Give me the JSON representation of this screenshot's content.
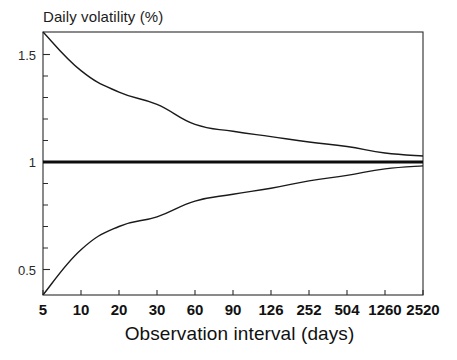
{
  "chart_data": {
    "type": "line",
    "title": "",
    "ylabel": "Daily volatility (%)",
    "xlabel": "Observation interval (days)",
    "categories": [
      "5",
      "10",
      "20",
      "30",
      "60",
      "90",
      "126",
      "252",
      "504",
      "1260",
      "2520"
    ],
    "x_tick_labels": [
      "5",
      "10",
      "20",
      "30",
      "60",
      "90",
      "126",
      "252",
      "504",
      "1260",
      "2520"
    ],
    "y_tick_labels": [
      "1.5",
      "1",
      "0.5"
    ],
    "y_tick_values": [
      1.5,
      1.0,
      0.5
    ],
    "ylim": [
      0.38,
      1.62
    ],
    "xlim": [
      0,
      10
    ],
    "grid": false,
    "legend": "none",
    "axis_note": "x-axis is categorical/log-like; ticks evenly spaced",
    "minor_ticks_y": [
      1.4,
      1.3,
      1.2,
      1.1,
      0.9,
      0.8,
      0.7,
      0.6
    ],
    "series": [
      {
        "name": "Upper confidence bound",
        "color": "#1a1a1a",
        "width": 1.4,
        "values": [
          1.605,
          1.425,
          1.325,
          1.268,
          1.175,
          1.143,
          1.118,
          1.093,
          1.072,
          1.042,
          1.028
        ]
      },
      {
        "name": "True volatility (reference)",
        "color": "#0d0d0d",
        "width": 3.0,
        "values": [
          1.0,
          1.0,
          1.0,
          1.0,
          1.0,
          1.0,
          1.0,
          1.0,
          1.0,
          1.0,
          1.0
        ]
      },
      {
        "name": "Lower confidence bound",
        "color": "#1a1a1a",
        "width": 1.4,
        "values": [
          0.382,
          0.592,
          0.7,
          0.745,
          0.818,
          0.85,
          0.878,
          0.912,
          0.938,
          0.968,
          0.982
        ]
      }
    ]
  },
  "plot_area": {
    "left": 43,
    "top": 32,
    "right": 423,
    "bottom": 295,
    "frame_color": "#2b2b2b"
  }
}
